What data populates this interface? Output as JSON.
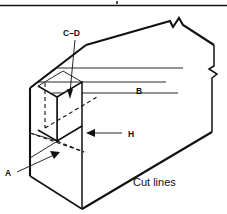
{
  "figure": {
    "title_rule": "horizontal-rule-top",
    "labels": {
      "a": "A",
      "b": "B",
      "cd": "C–D",
      "h": "H",
      "cut_lines": "Cut lines"
    },
    "colors": {
      "ink": "#111111",
      "paper": "#ffffff"
    },
    "annotations": [
      {
        "name": "label-a",
        "text": "A",
        "x": 8,
        "y": 176,
        "leader": "points up-right to bottom notch face"
      },
      {
        "name": "label-b",
        "text": "B",
        "x": 136,
        "y": 94,
        "leader": "none"
      },
      {
        "name": "label-cd",
        "text": "C–D",
        "x": 63,
        "y": 36,
        "leader": "points down to groove on top face"
      },
      {
        "name": "label-h",
        "text": "H",
        "x": 128,
        "y": 137,
        "leader": "points left to front vertical face"
      },
      {
        "name": "label-cut-lines",
        "text": "Cut lines",
        "x": 133,
        "y": 186,
        "leader": "none"
      }
    ],
    "break_symbols": [
      {
        "name": "break-top-edge",
        "x": 176,
        "y": 24
      },
      {
        "name": "break-right-edge",
        "x": 202,
        "y": 72
      }
    ]
  }
}
